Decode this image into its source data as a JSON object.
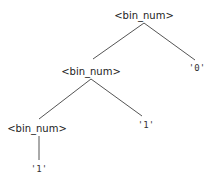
{
  "tree": {
    "nodes": [
      {
        "id": "root",
        "label": "<bin_num>",
        "x": 144,
        "y": 15,
        "kind": "nonterminal"
      },
      {
        "id": "n1",
        "label": "<bin_num>",
        "x": 91,
        "y": 71,
        "kind": "nonterminal"
      },
      {
        "id": "leaf0",
        "label": "'0'",
        "x": 197,
        "y": 68,
        "kind": "terminal"
      },
      {
        "id": "n2",
        "label": "<bin_num>",
        "x": 37,
        "y": 128,
        "kind": "nonterminal"
      },
      {
        "id": "leaf1a",
        "label": "'1'",
        "x": 146,
        "y": 125,
        "kind": "terminal"
      },
      {
        "id": "leaf1b",
        "label": "'1'",
        "x": 39,
        "y": 169,
        "kind": "terminal"
      }
    ],
    "edges": [
      {
        "from": "root",
        "to": "n1"
      },
      {
        "from": "root",
        "to": "leaf0"
      },
      {
        "from": "n1",
        "to": "n2"
      },
      {
        "from": "n1",
        "to": "leaf1a"
      },
      {
        "from": "n2",
        "to": "leaf1b"
      }
    ]
  },
  "line_color": "#555555"
}
